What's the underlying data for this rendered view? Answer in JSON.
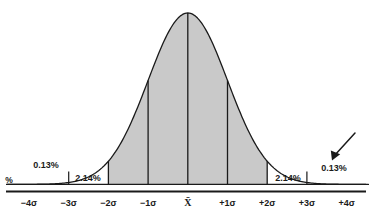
{
  "chart_data": {
    "type": "area",
    "title": "",
    "subtitle": "",
    "xlabel": "",
    "ylabel": "%",
    "x_axis": {
      "categories": [
        "-4σ",
        "-3σ",
        "-2σ",
        "-1σ",
        "X̄",
        "+1σ",
        "+2σ",
        "+3σ",
        "+4σ"
      ],
      "tick_values": [
        -4,
        -3,
        -2,
        -1,
        0,
        1,
        2,
        3,
        4
      ],
      "xlim": [
        -4.7,
        4.7
      ],
      "grid": false
    },
    "y_axis": {
      "ylim": [
        0,
        1
      ],
      "grid": false,
      "ticks_shown": false
    },
    "curve": {
      "name": "normal-distribution",
      "mean_symbol": "X̄",
      "stroke": "#1a1a1a",
      "shaded_region": {
        "from": -2,
        "to": 2,
        "fill": "#c9c9c9"
      }
    },
    "band_annotations": [
      {
        "label": "0.13%",
        "value": 0.13,
        "range": "beyond -3σ",
        "side": "left",
        "x": 1.45,
        "y_px": 165
      },
      {
        "label": "2.14%",
        "value": 2.14,
        "range": "-3σ to -2σ",
        "side": "left",
        "x": 2.51,
        "y_px": 178
      },
      {
        "label": "2.14%",
        "value": 2.14,
        "range": "+2σ to +3σ",
        "side": "right",
        "x": 2.51,
        "y_px": 178
      },
      {
        "label": "0.13%",
        "value": 0.13,
        "range": "beyond +3σ",
        "side": "right",
        "x": 3.49,
        "y_px": 165
      }
    ],
    "vertical_dividers": [
      -2,
      -1,
      0,
      1,
      2
    ],
    "tick_marks": [
      -3,
      3
    ],
    "legend": {
      "show": false
    },
    "annotations": [
      {
        "type": "arrow",
        "name": "tail-pointer-arrow",
        "points_to": "right tail beyond +3σ",
        "tail": [
          355,
          133
        ],
        "tip": [
          332,
          159
        ]
      }
    ]
  },
  "labels": {
    "percent_unit": "%",
    "sigma_minus_4": "−4σ",
    "sigma_minus_3": "−3σ",
    "sigma_minus_2": "−2σ",
    "sigma_minus_1": "−1σ",
    "mean": "X̄",
    "sigma_plus_1": "+1σ",
    "sigma_plus_2": "+2σ",
    "sigma_plus_3": "+3σ",
    "sigma_plus_4": "+4σ",
    "pct_left_outer": "0.13%",
    "pct_left_inner": "2.14%",
    "pct_right_inner": "2.14%",
    "pct_right_outer": "0.13%"
  },
  "colors": {
    "shade": "#c9c9c9",
    "line": "#1a1a1a",
    "text": "#1a1a1a",
    "background": "#ffffff"
  }
}
